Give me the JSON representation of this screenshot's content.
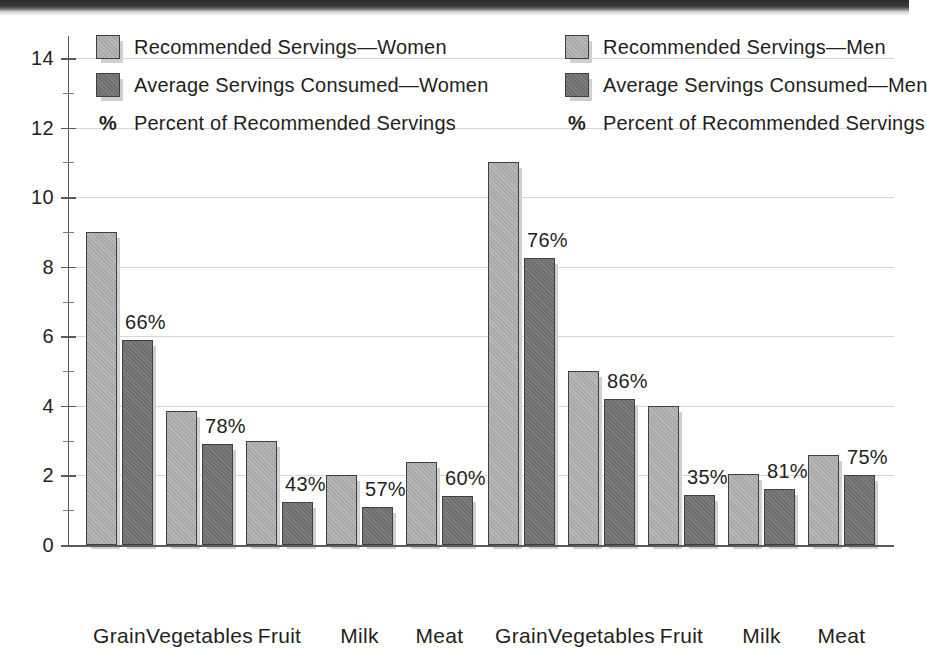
{
  "legend": {
    "left": [
      {
        "kind": "swatch-light",
        "label": "Recommended Servings—Women"
      },
      {
        "kind": "swatch-dark",
        "label": "Average Servings Consumed—Women"
      },
      {
        "kind": "percent-mark",
        "mark": "%",
        "label": "Percent of Recommended Servings"
      }
    ],
    "right": [
      {
        "kind": "swatch-light",
        "label": "Recommended Servings—Men"
      },
      {
        "kind": "swatch-dark",
        "label": "Average Servings Consumed—Men"
      },
      {
        "kind": "percent-mark",
        "mark": "%",
        "label": "Percent of Recommended Servings"
      }
    ]
  },
  "colors": {
    "recommended": "#a9a9a9",
    "consumed": "#6e6e6e",
    "bar_border": "#3f3f3f",
    "gridline": "#d6d6d6",
    "axis": "#5a5a5a",
    "text": "#231f20",
    "background": "#ffffff"
  },
  "chart_data": {
    "type": "bar",
    "title": "",
    "subtitle": "",
    "xlabel": "",
    "ylabel": "",
    "ylim": [
      0,
      14
    ],
    "y_ticks": [
      0,
      2,
      4,
      6,
      8,
      10,
      12,
      14
    ],
    "y_tick_labels": [
      "0",
      "2",
      "4",
      "6",
      "8",
      "10",
      "12",
      "14"
    ],
    "y_minor_ticks": [
      1,
      3,
      5,
      7,
      9,
      11,
      13
    ],
    "grid": true,
    "grid_axis": "y",
    "legend_position": "top",
    "panels": [
      {
        "name": "Women",
        "categories": [
          "Grain",
          "Vegetables",
          "Fruit",
          "Milk",
          "Meat"
        ],
        "series": [
          {
            "name": "Recommended Servings—Women",
            "values": [
              9,
              3.85,
              3,
              2,
              2.4
            ]
          },
          {
            "name": "Average Servings Consumed—Women",
            "values": [
              5.9,
              2.9,
              1.25,
              1.1,
              1.4
            ]
          }
        ],
        "percent_labels": [
          "66%",
          "78%",
          "43%",
          "57%",
          "60%"
        ]
      },
      {
        "name": "Men",
        "categories": [
          "Grain",
          "Vegetables",
          "Fruit",
          "Milk",
          "Meat"
        ],
        "series": [
          {
            "name": "Recommended Servings—Men",
            "values": [
              11,
              5,
              4,
              2.05,
              2.6
            ]
          },
          {
            "name": "Average Servings Consumed—Men",
            "values": [
              8.25,
              4.2,
              1.45,
              1.6,
              2.0
            ]
          }
        ],
        "percent_labels": [
          "76%",
          "86%",
          "35%",
          "81%",
          "75%"
        ]
      }
    ]
  }
}
